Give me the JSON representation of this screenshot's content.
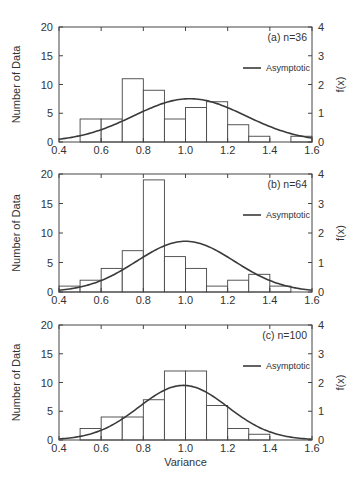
{
  "chart_data": [
    {
      "type": "bar",
      "panel": "a",
      "title": "(a) n=36",
      "xlabel": "",
      "ylabel": "Number of Data",
      "y2label": "f(x)",
      "xlim": [
        0.4,
        1.6
      ],
      "ylim": [
        0,
        20
      ],
      "y2lim": [
        0,
        4
      ],
      "xticks": [
        "0.4",
        "0.6",
        "0.8",
        "1.0",
        "1.2",
        "1.4",
        "1.6"
      ],
      "yticks": [
        "0",
        "5",
        "10",
        "15",
        "20"
      ],
      "y2ticks": [
        "0",
        "1",
        "2",
        "3",
        "4"
      ],
      "bin_width": 0.1,
      "categories": [
        "0.4-0.5",
        "0.5-0.6",
        "0.6-0.7",
        "0.7-0.8",
        "0.8-0.9",
        "0.9-1.0",
        "1.0-1.1",
        "1.1-1.2",
        "1.2-1.3",
        "1.3-1.4",
        "1.4-1.5",
        "1.5-1.6"
      ],
      "bin_starts": [
        0.4,
        0.5,
        0.6,
        0.7,
        0.8,
        0.9,
        1.0,
        1.1,
        1.2,
        1.3,
        1.4,
        1.5
      ],
      "values": [
        0,
        4,
        4,
        11,
        9,
        4,
        6,
        7,
        3,
        1,
        0,
        1
      ],
      "legend": [
        {
          "label": "Asymptotic",
          "style": "line"
        }
      ],
      "legend_position": "upper right",
      "grid": false,
      "curve": {
        "name": "Asymptotic",
        "axis": "right",
        "mean": 1.02,
        "sd": 0.265,
        "peak": 1.5
      }
    },
    {
      "type": "bar",
      "panel": "b",
      "title": "(b) n=64",
      "xlabel": "",
      "ylabel": "Number of Data",
      "y2label": "f(x)",
      "xlim": [
        0.4,
        1.6
      ],
      "ylim": [
        0,
        20
      ],
      "y2lim": [
        0,
        4
      ],
      "xticks": [
        "0.4",
        "0.6",
        "0.8",
        "1.0",
        "1.2",
        "1.4",
        "1.6"
      ],
      "yticks": [
        "0",
        "5",
        "10",
        "15",
        "20"
      ],
      "y2ticks": [
        "0",
        "1",
        "2",
        "3",
        "4"
      ],
      "bin_width": 0.1,
      "categories": [
        "0.4-0.5",
        "0.5-0.6",
        "0.6-0.7",
        "0.7-0.8",
        "0.8-0.9",
        "0.9-1.0",
        "1.0-1.1",
        "1.1-1.2",
        "1.2-1.3",
        "1.3-1.4",
        "1.4-1.5",
        "1.5-1.6"
      ],
      "bin_starts": [
        0.4,
        0.5,
        0.6,
        0.7,
        0.8,
        0.9,
        1.0,
        1.1,
        1.2,
        1.3,
        1.4,
        1.5
      ],
      "values": [
        1,
        2,
        4,
        7,
        19,
        6,
        4,
        1,
        2,
        3,
        1,
        0
      ],
      "legend": [
        {
          "label": "Asymptotic",
          "style": "line"
        }
      ],
      "legend_position": "upper right",
      "grid": false,
      "curve": {
        "name": "Asymptotic",
        "axis": "right",
        "mean": 1.0,
        "sd": 0.232,
        "peak": 1.72
      }
    },
    {
      "type": "bar",
      "panel": "c",
      "title": "(c) n=100",
      "xlabel": "Variance",
      "ylabel": "Number of Data",
      "y2label": "f(x)",
      "xlim": [
        0.4,
        1.6
      ],
      "ylim": [
        0,
        20
      ],
      "y2lim": [
        0,
        4
      ],
      "xticks": [
        "0.4",
        "0.6",
        "0.8",
        "1.0",
        "1.2",
        "1.4",
        "1.6"
      ],
      "yticks": [
        "0",
        "5",
        "10",
        "15",
        "20"
      ],
      "y2ticks": [
        "0",
        "1",
        "2",
        "3",
        "4"
      ],
      "bin_width": 0.1,
      "categories": [
        "0.4-0.5",
        "0.5-0.6",
        "0.6-0.7",
        "0.7-0.8",
        "0.8-0.9",
        "0.9-1.0",
        "1.0-1.1",
        "1.1-1.2",
        "1.2-1.3",
        "1.3-1.4",
        "1.4-1.5",
        "1.5-1.6"
      ],
      "bin_starts": [
        0.4,
        0.5,
        0.6,
        0.7,
        0.8,
        0.9,
        1.0,
        1.1,
        1.2,
        1.3,
        1.4,
        1.5
      ],
      "values": [
        0,
        2,
        4,
        4,
        7,
        12,
        12,
        6,
        2,
        1,
        0,
        0
      ],
      "legend": [
        {
          "label": "Asymptotic",
          "style": "line"
        }
      ],
      "legend_position": "upper right",
      "grid": false,
      "curve": {
        "name": "Asymptotic",
        "axis": "right",
        "mean": 0.99,
        "sd": 0.21,
        "peak": 1.9
      }
    }
  ]
}
